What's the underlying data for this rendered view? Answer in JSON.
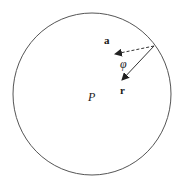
{
  "diagram": {
    "circle": {
      "cx": 92,
      "cy": 94,
      "rx": 79,
      "ry": 81,
      "stroke": "#555555"
    },
    "origin": {
      "x": 154,
      "y": 46
    },
    "vectors": [
      {
        "name": "a",
        "label": "a",
        "style": "dashed",
        "tip": {
          "x": 115,
          "y": 54
        }
      },
      {
        "name": "r",
        "label": "r",
        "style": "solid",
        "tip": {
          "x": 122,
          "y": 80
        }
      }
    ],
    "angle_label": "φ",
    "point_label": "P",
    "colors": {
      "stroke": "#333333",
      "text": "#1a1a1a",
      "background": "#ffffff"
    }
  }
}
